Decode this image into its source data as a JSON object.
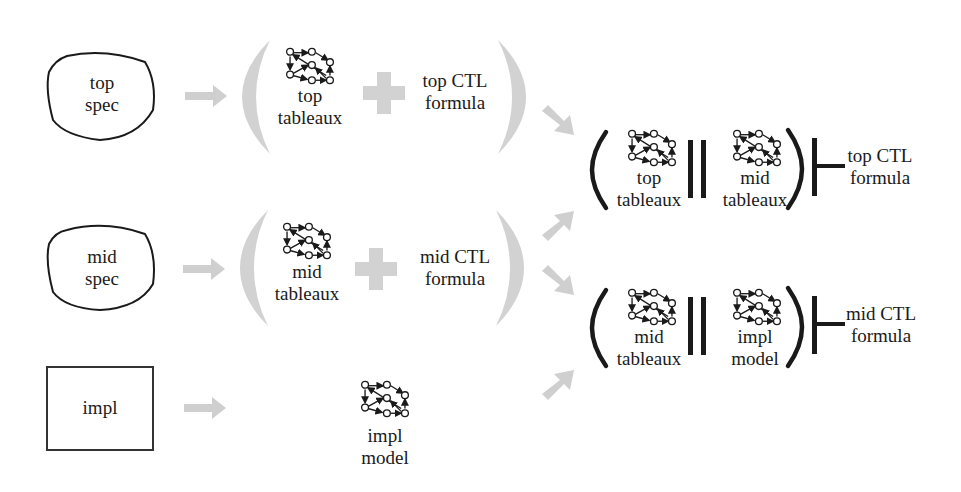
{
  "colors": {
    "arrow_gray": "#cfcfcf",
    "paren_gray": "#d2d2d2",
    "ink": "#1a1a1a"
  },
  "rows": {
    "top": {
      "spec": {
        "line1": "top",
        "line2": "spec",
        "shape": "blob"
      },
      "tableaux": {
        "line1": "top",
        "line2": "tableaux"
      },
      "formula": {
        "line1": "top CTL",
        "line2": "formula"
      }
    },
    "mid": {
      "spec": {
        "line1": "mid",
        "line2": "spec",
        "shape": "blob"
      },
      "tableaux": {
        "line1": "mid",
        "line2": "tableaux"
      },
      "formula": {
        "line1": "mid CTL",
        "line2": "formula"
      }
    },
    "impl": {
      "spec": {
        "line1": "impl",
        "shape": "rectangle"
      },
      "model": {
        "line1": "impl",
        "line2": "model"
      }
    }
  },
  "results": {
    "top_check": {
      "left": {
        "line1": "top",
        "line2": "tableaux"
      },
      "right": {
        "line1": "mid",
        "line2": "tableaux"
      },
      "operator": "||",
      "entails": "⊢",
      "formula": {
        "line1": "top CTL",
        "line2": "formula"
      }
    },
    "mid_check": {
      "left": {
        "line1": "mid",
        "line2": "tableaux"
      },
      "right": {
        "line1": "impl",
        "line2": "model"
      },
      "operator": "||",
      "entails": "⊢",
      "formula": {
        "line1": "mid CTL",
        "line2": "formula"
      }
    }
  },
  "icons": {
    "graph": "state-transition-graph-icon",
    "plus": "plus-icon",
    "arrow": "arrow-icon"
  }
}
